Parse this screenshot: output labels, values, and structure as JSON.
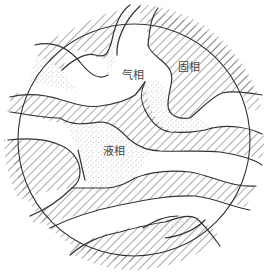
{
  "diagram": {
    "type": "three-phase soil structure schematic",
    "labels": {
      "gas_phase": "气相",
      "solid_phase": "固相",
      "liquid_phase": "液相"
    },
    "legend_hints": {
      "solid_phase_fill": "diagonal hatching",
      "liquid_phase_fill": "stippled dots",
      "gas_phase_fill": "white"
    },
    "colors": {
      "line": "#333333",
      "hatch": "#555555",
      "stipple": "#777777",
      "background": "#ffffff"
    }
  }
}
